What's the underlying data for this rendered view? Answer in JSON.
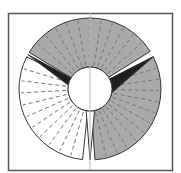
{
  "diagram": {
    "title": "",
    "kind": "segmented ring diagram",
    "frame": {
      "x": 8,
      "y": 13,
      "width": 164,
      "height": 157,
      "stroke": "#555555"
    },
    "center": {
      "x": 90,
      "y": 89
    },
    "outer_radius": 71,
    "inner_radius": 22,
    "axis_line": {
      "x": 90,
      "color": "#bbbbbb"
    },
    "colors": {
      "gray_fill": "#a9a9a9",
      "white_fill": "#ffffff",
      "black_fill": "#1e1e1e",
      "outline": "#333333",
      "dash": "#777777"
    },
    "sectors": [
      {
        "name": "top-gray-sector",
        "start_deg": -59,
        "end_deg": 58,
        "fill": "gray",
        "dashed_spokes": 12
      },
      {
        "name": "right-gray-sector",
        "start_deg": 63,
        "end_deg": 176,
        "fill": "gray",
        "dashed_spokes": 12
      },
      {
        "name": "left-white-sector",
        "start_deg": 186,
        "end_deg": 297,
        "fill": "white",
        "dashed_spokes": 11
      }
    ],
    "wedges": [
      {
        "name": "right-black-wedge",
        "outer_deg": 63,
        "inner_start_deg": 63,
        "inner_end_deg": 100,
        "fill": "black"
      },
      {
        "name": "left-black-wedge",
        "outer_deg": 299,
        "inner_start_deg": 280,
        "inner_end_deg": 300,
        "fill": "black"
      },
      {
        "name": "bottom-white-wedge",
        "outer_deg": 180,
        "inner_start_deg": 168,
        "inner_end_deg": 190,
        "fill": "white"
      }
    ]
  }
}
